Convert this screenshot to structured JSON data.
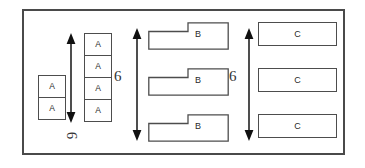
{
  "diagram": {
    "frame": {
      "name": "outer-border"
    },
    "colors": {
      "border": "#4a4a4a",
      "box_border": "#4d4d4d",
      "text": "#2a2a2a",
      "arrow": "#222222",
      "background": "#ffffff"
    },
    "groups": [
      {
        "id": "group-a",
        "label": "A",
        "short_stack": {
          "count": 2,
          "labels": [
            "A",
            "A"
          ]
        },
        "tall_stack": {
          "count": 4,
          "labels": [
            "A",
            "A",
            "A",
            "A"
          ]
        }
      },
      {
        "id": "group-b",
        "label": "B",
        "count": 3,
        "labels": [
          "B",
          "B",
          "B"
        ],
        "shape": "stepped-polygon"
      },
      {
        "id": "group-c",
        "label": "C",
        "count": 3,
        "labels": [
          "C",
          "C",
          "C"
        ],
        "shape": "rectangle"
      }
    ],
    "dimensions": [
      {
        "id": "dim-left",
        "value": "6",
        "orientation": "vertical",
        "arrow": "double-headed"
      },
      {
        "id": "dim-middle",
        "value": "6",
        "orientation": "vertical",
        "arrow": "double-headed"
      },
      {
        "id": "dim-right",
        "value": "6",
        "orientation": "vertical",
        "arrow": "double-headed"
      }
    ],
    "annotations": [
      {
        "id": "rotated-six",
        "value": "6",
        "rotation_deg": 90
      }
    ]
  }
}
